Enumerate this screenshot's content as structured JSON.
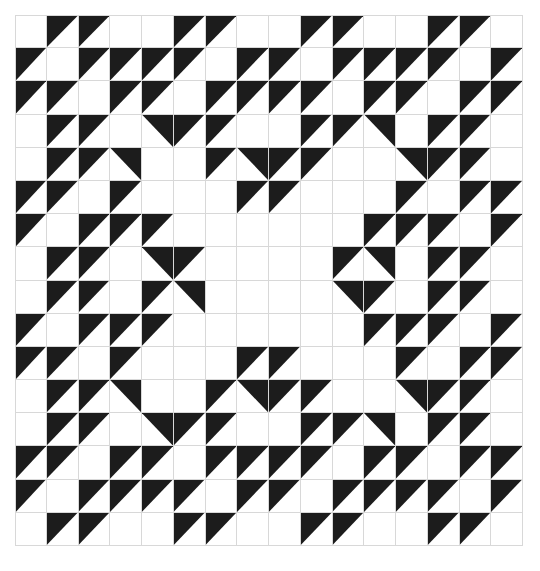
{
  "figure": {
    "name": "quilt-pattern",
    "caption": "",
    "colors": {
      "fill": "#1c1c1c",
      "background": "#ffffff",
      "gridline": "#d8d8d8"
    },
    "grid": {
      "rows": 16,
      "cols": 16,
      "cell_size_px": 32,
      "origin_x_px": 15,
      "origin_y_px": 15
    },
    "legend": {
      "e": "empty",
      "f": "full",
      "tl": "top-left-triangle",
      "tr": "top-right-triangle",
      "bl": "bottom-left-triangle",
      "br": "bottom-right-triangle"
    }
  },
  "chart_data": {
    "type": "heatmap",
    "xlabel": "",
    "ylabel": "",
    "categories": [
      "c0",
      "c1",
      "c2",
      "c3",
      "c4",
      "c5",
      "c6",
      "c7",
      "c8",
      "c9",
      "c10",
      "c11",
      "c12",
      "c13",
      "c14",
      "c15"
    ],
    "rows": [
      [
        "e",
        "tl",
        "tl",
        "e",
        "e",
        "tl",
        "tl",
        "e",
        "e",
        "tl",
        "tl",
        "e",
        "e",
        "tl",
        "tl",
        "e"
      ],
      [
        "tl",
        "e",
        "tl",
        "tl",
        "tl",
        "tl",
        "e",
        "tl",
        "tl",
        "e",
        "tl",
        "tl",
        "tl",
        "tl",
        "e",
        "tl"
      ],
      [
        "tl",
        "tl",
        "e",
        "tl",
        "tl",
        "e",
        "tl",
        "tl",
        "tl",
        "tl",
        "e",
        "tl",
        "tl",
        "e",
        "tl",
        "tl"
      ],
      [
        "e",
        "tl",
        "tl",
        "e",
        "tr",
        "tl",
        "tl",
        "e",
        "e",
        "tl",
        "tl",
        "tr",
        "e",
        "tl",
        "tl",
        "e"
      ],
      [
        "e",
        "tl",
        "tl",
        "tr",
        "e",
        "e",
        "tl",
        "tr",
        "tl",
        "tl",
        "e",
        "e",
        "tr",
        "tl",
        "tl",
        "e"
      ],
      [
        "tl",
        "tl",
        "e",
        "tl",
        "e",
        "e",
        "e",
        "tl",
        "tl",
        "e",
        "e",
        "e",
        "tl",
        "e",
        "tl",
        "tl"
      ],
      [
        "tl",
        "e",
        "tl",
        "tl",
        "tl",
        "e",
        "e",
        "e",
        "e",
        "e",
        "e",
        "tl",
        "tl",
        "tl",
        "e",
        "tl"
      ],
      [
        "e",
        "tl",
        "tl",
        "e",
        "tr",
        "tl",
        "e",
        "e",
        "e",
        "e",
        "tl",
        "tr",
        "e",
        "tl",
        "tl",
        "e"
      ],
      [
        "e",
        "tl",
        "tl",
        "e",
        "tl",
        "tr",
        "e",
        "e",
        "e",
        "e",
        "tr",
        "tl",
        "e",
        "tl",
        "tl",
        "e"
      ],
      [
        "tl",
        "e",
        "tl",
        "tl",
        "tl",
        "e",
        "e",
        "e",
        "e",
        "e",
        "e",
        "tl",
        "tl",
        "tl",
        "e",
        "tl"
      ],
      [
        "tl",
        "tl",
        "e",
        "tl",
        "e",
        "e",
        "e",
        "tl",
        "tl",
        "e",
        "e",
        "e",
        "tl",
        "e",
        "tl",
        "tl"
      ],
      [
        "e",
        "tl",
        "tl",
        "tr",
        "e",
        "e",
        "tl",
        "tr",
        "tl",
        "tl",
        "e",
        "e",
        "tr",
        "tl",
        "tl",
        "e"
      ],
      [
        "e",
        "tl",
        "tl",
        "e",
        "tr",
        "tl",
        "tl",
        "e",
        "e",
        "tl",
        "tl",
        "tr",
        "e",
        "tl",
        "tl",
        "e"
      ],
      [
        "tl",
        "tl",
        "e",
        "tl",
        "tl",
        "e",
        "tl",
        "tl",
        "tl",
        "tl",
        "e",
        "tl",
        "tl",
        "e",
        "tl",
        "tl"
      ],
      [
        "tl",
        "e",
        "tl",
        "tl",
        "tl",
        "tl",
        "e",
        "tl",
        "tl",
        "e",
        "tl",
        "tl",
        "tl",
        "tl",
        "e",
        "tl"
      ],
      [
        "e",
        "tl",
        "tl",
        "e",
        "e",
        "tl",
        "tl",
        "e",
        "e",
        "tl",
        "tl",
        "e",
        "e",
        "tl",
        "tl",
        "e"
      ]
    ]
  }
}
